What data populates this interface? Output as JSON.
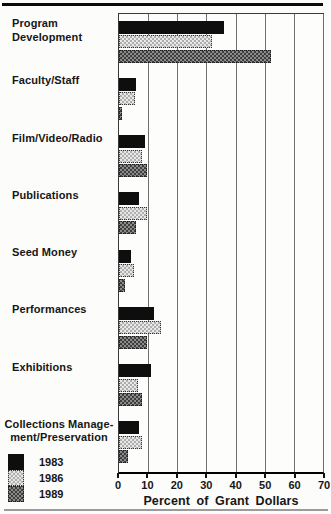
{
  "figure": {
    "background": "#fcfcfa",
    "text_color": "#161616"
  },
  "chart_data": {
    "type": "bar",
    "orientation": "horizontal",
    "title": "",
    "xlabel": "Percent of Grant Dollars",
    "ylabel": "",
    "xlim": [
      0,
      70
    ],
    "x_ticks": [
      0,
      10,
      20,
      30,
      40,
      50,
      60,
      70
    ],
    "grid": true,
    "legend_position": "bottom-left",
    "categories": [
      "Program Development",
      "Faculty/Staff",
      "Film/Video/Radio",
      "Publications",
      "Seed Money",
      "Performances",
      "Exhibitions",
      "Collections Management/Preservation"
    ],
    "category_label_lines": [
      [
        "Program",
        "Development"
      ],
      [
        "Faculty/Staff"
      ],
      [
        "Film/Video/Radio"
      ],
      [
        "Publications"
      ],
      [
        "Seed Money"
      ],
      [
        "Performances"
      ],
      [
        "Exhibitions"
      ],
      [
        "Collections Manage-",
        "ment/Preservation"
      ]
    ],
    "series": [
      {
        "name": "1983",
        "pattern": "solid",
        "color": "#0e0e0e",
        "values": [
          36,
          6,
          9,
          7,
          4,
          12,
          11,
          7
        ]
      },
      {
        "name": "1986",
        "pattern": "checker-light",
        "color": "#c9c9c9",
        "values": [
          32,
          5.5,
          8,
          9.5,
          5,
          14.5,
          6.5,
          8
        ]
      },
      {
        "name": "1989",
        "pattern": "checker-dark",
        "color": "#6e6e6e",
        "values": [
          52,
          1,
          9.5,
          6,
          2,
          9.5,
          8,
          3
        ]
      }
    ]
  }
}
